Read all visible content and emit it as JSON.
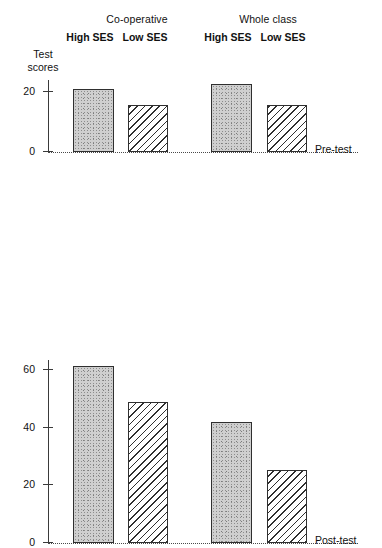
{
  "figure": {
    "y_axis_title_line1": "Test",
    "y_axis_title_line2": "scores",
    "groups": [
      {
        "name": "Co-operative",
        "subgroups": [
          "High SES",
          "Low SES"
        ]
      },
      {
        "name": "Whole class",
        "subgroups": [
          "High SES",
          "Low SES"
        ]
      }
    ],
    "panel_labels": {
      "pre": "Pre-test",
      "post": "Post-test"
    },
    "ticks_pre": [
      "20",
      "0"
    ],
    "ticks_post": [
      "60",
      "40",
      "20",
      "0"
    ]
  },
  "chart_data": [
    {
      "type": "bar",
      "title": "Pre-test",
      "xlabel": "",
      "ylabel": "Test scores",
      "categories": [
        "Co-operative / High SES",
        "Co-operative / Low SES",
        "Whole class / High SES",
        "Whole class / Low SES"
      ],
      "values": [
        21,
        15.5,
        22.5,
        15.5
      ],
      "ylim": [
        0,
        24
      ],
      "yticks": [
        0,
        20
      ],
      "grid": false,
      "legend": "none",
      "fills": [
        "stipple",
        "hatch",
        "stipple",
        "hatch"
      ]
    },
    {
      "type": "bar",
      "title": "Post-test",
      "xlabel": "",
      "ylabel": "Test scores",
      "categories": [
        "Co-operative / High SES",
        "Co-operative / Low SES",
        "Whole class / High SES",
        "Whole class / Low SES"
      ],
      "values": [
        63,
        50,
        43,
        26
      ],
      "ylim": [
        0,
        65
      ],
      "yticks": [
        0,
        20,
        40,
        60
      ],
      "grid": false,
      "legend": "none",
      "fills": [
        "stipple",
        "hatch",
        "stipple",
        "hatch"
      ]
    }
  ]
}
